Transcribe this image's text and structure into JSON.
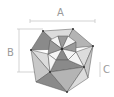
{
  "diagram": {
    "type": "polyhedron-dimensions",
    "labels": {
      "a": "A",
      "b": "B",
      "c": "C"
    },
    "colors": {
      "line": "#c8c8c8",
      "edge": "#555555",
      "dark_face": "#8a8a8a",
      "mid_face": "#b4b4b4",
      "light_face": "#dcdcdc",
      "white_face": "#f4f4f4"
    }
  }
}
